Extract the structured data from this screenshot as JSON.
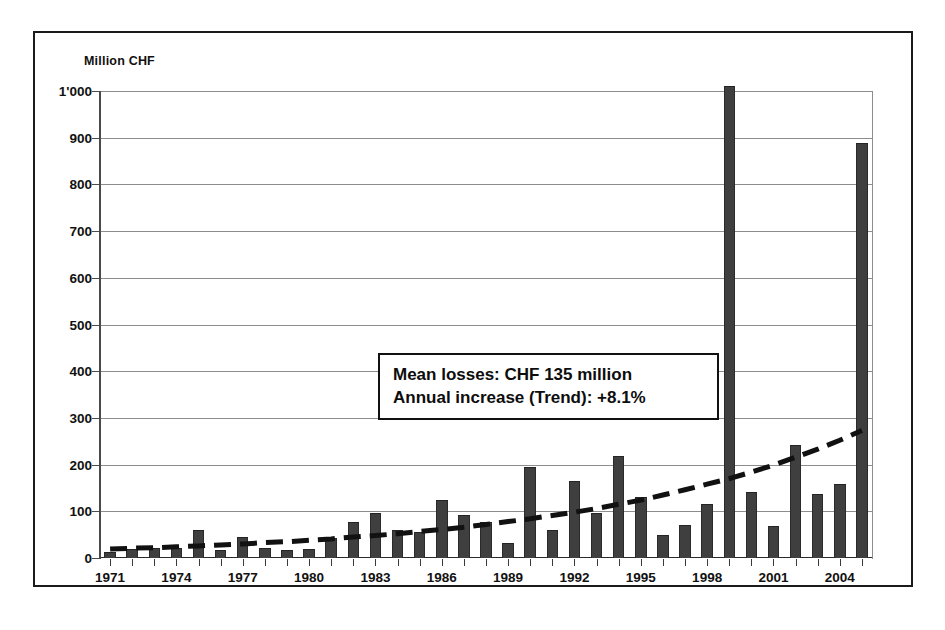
{
  "figure": {
    "unit_label": "Million CHF",
    "frame_color": "#1a1a1a"
  },
  "annotation": {
    "line1": "Mean losses: CHF 135 million",
    "line2": "Annual increase (Trend): +8.1%"
  },
  "chart_data": {
    "type": "bar",
    "title": "",
    "subtitle": "",
    "xlabel": "",
    "ylabel": "Million CHF",
    "ylim": [
      0,
      1000
    ],
    "xlim": [
      1971,
      2005
    ],
    "grid": true,
    "legend": "none",
    "ytick_labels": [
      "0",
      "100",
      "200",
      "300",
      "400",
      "500",
      "600",
      "700",
      "800",
      "900",
      "1'000"
    ],
    "ytick_values": [
      0,
      100,
      200,
      300,
      400,
      500,
      600,
      700,
      800,
      900,
      1000
    ],
    "xtick_labels": [
      "1971",
      "1974",
      "1977",
      "1980",
      "1983",
      "1986",
      "1989",
      "1992",
      "1995",
      "1998",
      "2001",
      "2004"
    ],
    "xtick_values": [
      1971,
      1974,
      1977,
      1980,
      1983,
      1986,
      1989,
      1992,
      1995,
      1998,
      2001,
      2004
    ],
    "categories": [
      1971,
      1972,
      1973,
      1974,
      1975,
      1976,
      1977,
      1978,
      1979,
      1980,
      1981,
      1982,
      1983,
      1984,
      1985,
      1986,
      1987,
      1988,
      1989,
      1990,
      1991,
      1992,
      1993,
      1994,
      1995,
      1996,
      1997,
      1998,
      1999,
      2000,
      2001,
      2002,
      2003,
      2004,
      2005
    ],
    "values": [
      12,
      20,
      22,
      22,
      60,
      18,
      44,
      22,
      18,
      20,
      42,
      78,
      97,
      60,
      55,
      124,
      92,
      77,
      33,
      195,
      60,
      164,
      97,
      218,
      130,
      50,
      70,
      115,
      1010,
      142,
      68,
      242,
      137,
      158,
      888
    ],
    "bar_color": "#3f3f3f",
    "series": [
      {
        "name": "Annual losses",
        "type": "bar",
        "values": [
          12,
          20,
          22,
          22,
          60,
          18,
          44,
          22,
          18,
          20,
          42,
          78,
          97,
          60,
          55,
          124,
          92,
          77,
          33,
          195,
          60,
          164,
          97,
          218,
          130,
          50,
          70,
          115,
          1010,
          142,
          68,
          242,
          137,
          158,
          888
        ]
      },
      {
        "name": "Trend",
        "type": "line",
        "style": "dashed",
        "color": "#111111",
        "values": [
          19,
          21,
          22,
          24,
          26,
          28,
          30,
          33,
          35,
          38,
          41,
          45,
          48,
          52,
          57,
          61,
          66,
          72,
          78,
          84,
          91,
          98,
          106,
          115,
          124,
          135,
          146,
          158,
          170,
          184,
          199,
          216,
          233,
          252,
          273
        ]
      }
    ],
    "annotations": [
      "Mean losses: CHF 135 million",
      "Annual increase (Trend): +8.1%"
    ],
    "mean_losses_million_chf": 135,
    "annual_increase_trend_percent": 8.1
  }
}
